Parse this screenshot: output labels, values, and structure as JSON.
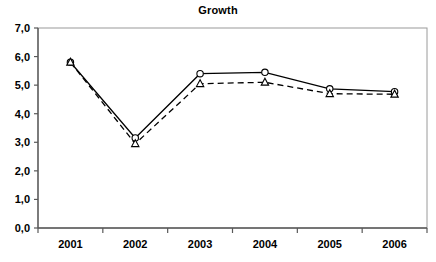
{
  "chart_data": {
    "type": "line",
    "title": "Growth",
    "xlabel": "",
    "ylabel": "",
    "categories": [
      "2001",
      "2002",
      "2003",
      "2004",
      "2005",
      "2006"
    ],
    "series": [
      {
        "name": "series-solid-circle",
        "marker": "circle",
        "line_style": "solid",
        "color": "#000000",
        "values": [
          5.8,
          3.15,
          5.4,
          5.45,
          4.87,
          4.77
        ]
      },
      {
        "name": "series-dashed-triangle",
        "marker": "triangle",
        "line_style": "dashed",
        "color": "#000000",
        "values": [
          5.8,
          2.95,
          5.05,
          5.1,
          4.7,
          4.68
        ]
      }
    ],
    "ylim": [
      0,
      7
    ],
    "y_ticks": [
      "0,0",
      "1,0",
      "2,0",
      "3,0",
      "4,0",
      "5,0",
      "6,0",
      "7,0"
    ],
    "y_tick_values": [
      0,
      1,
      2,
      3,
      4,
      5,
      6,
      7
    ],
    "grid": false,
    "legend": "none",
    "axis_color": "#808080",
    "plot_background": "#ffffff"
  }
}
